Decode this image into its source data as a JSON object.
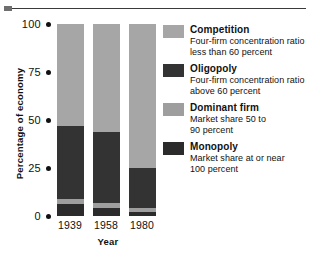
{
  "chart_data": {
    "type": "bar",
    "subtype": "stacked-bar",
    "title": "",
    "xlabel": "Year",
    "ylabel": "Percentage of economy",
    "categories": [
      "1939",
      "1958",
      "1980"
    ],
    "ylim": [
      0,
      100
    ],
    "yticks": [
      "0",
      "25",
      "50",
      "75",
      "100"
    ],
    "ytick_values": [
      0,
      25,
      50,
      75,
      100
    ],
    "grid": false,
    "legend_position": "right",
    "stack_order_bottom_up": [
      "Monopoly",
      "Dominant firm",
      "Oligopoly",
      "Competition"
    ],
    "series": [
      {
        "name": "Monopoly",
        "color": "#2b2b2b",
        "values": [
          6,
          4,
          2
        ]
      },
      {
        "name": "Dominant firm",
        "color": "#9e9e9e",
        "values": [
          3,
          3,
          2
        ]
      },
      {
        "name": "Oligopoly",
        "color": "#333333",
        "values": [
          38,
          37,
          21
        ]
      },
      {
        "name": "Competition",
        "color": "#a6a6a6",
        "values": [
          53,
          56,
          75
        ]
      }
    ]
  },
  "axes": {
    "y_label": "Percentage of economy",
    "x_label": "Year",
    "y_ticks": [
      "100",
      "75",
      "50",
      "25",
      "0"
    ],
    "x_ticks": [
      "1939",
      "1958",
      "1980"
    ]
  },
  "legend": {
    "items": [
      {
        "label": "Competition",
        "desc_line1": "Four-firm concentration ratio",
        "desc_line2": "less than 60 percent",
        "color": "#a6a6a6"
      },
      {
        "label": "Oligopoly",
        "desc_line1": "Four-firm concentration ratio",
        "desc_line2": "above 60 percent",
        "color": "#333333"
      },
      {
        "label": "Dominant firm",
        "desc_line1": "Market share 50 to",
        "desc_line2": "90 percent",
        "color": "#9e9e9e"
      },
      {
        "label": "Monopoly",
        "desc_line1": "Market share at or near",
        "desc_line2": "100 percent",
        "color": "#2b2b2b"
      }
    ]
  }
}
